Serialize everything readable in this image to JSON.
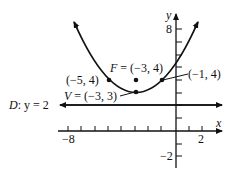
{
  "diagram": {
    "type": "parabola-graph",
    "equation": "(x + 3)^2 = 4(y - 3)",
    "axes": {
      "x_label": "x",
      "y_label": "y",
      "x_tick_labels": [
        "-8",
        "2"
      ],
      "y_tick_labels": [
        "8",
        "-2"
      ],
      "x_range": [
        -9,
        3
      ],
      "y_range": [
        -3,
        9
      ]
    },
    "focus": {
      "label": "F = (-3, 4)",
      "x": -3,
      "y": 4
    },
    "vertex": {
      "label": "V = (-3, 3)",
      "x": -3,
      "y": 3
    },
    "points": [
      {
        "label": "(-5, 4)",
        "x": -5,
        "y": 4
      },
      {
        "label": "(-1, 4)",
        "x": -1,
        "y": 4
      }
    ],
    "directrix": {
      "label": "D: y = 2",
      "y": 2
    },
    "colors": {
      "stroke": "#111111",
      "background": "#ffffff"
    }
  }
}
